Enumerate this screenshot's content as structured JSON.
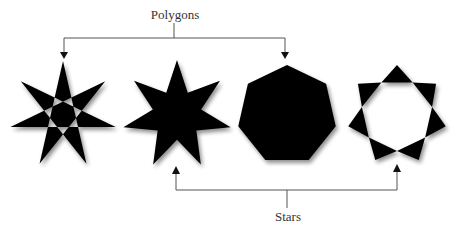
{
  "diagram": {
    "top_label": "Polygons",
    "bottom_label": "Stars",
    "colors": {
      "shape_fill": "#000000",
      "connector": "#555555",
      "text": "#333333",
      "background": "#ffffff"
    },
    "shapes": [
      {
        "name": "heptagram-outline",
        "description": "7-pointed star {7/3} with heptagonal hole",
        "cx": 63,
        "cy": 115,
        "r": 54,
        "category": [
          "Polygons",
          "Stars"
        ]
      },
      {
        "name": "heptagram-filled",
        "description": "solid 7-pointed star",
        "cx": 177,
        "cy": 115,
        "r": 55,
        "category": [
          "Stars"
        ]
      },
      {
        "name": "heptagon",
        "description": "solid regular heptagon",
        "cx": 287,
        "cy": 115,
        "r": 50,
        "category": [
          "Polygons"
        ]
      },
      {
        "name": "heptagram-ring",
        "description": "7 triangles around heptagonal hole",
        "cx": 397,
        "cy": 115,
        "r": 50,
        "category": [
          "Stars"
        ]
      }
    ]
  }
}
